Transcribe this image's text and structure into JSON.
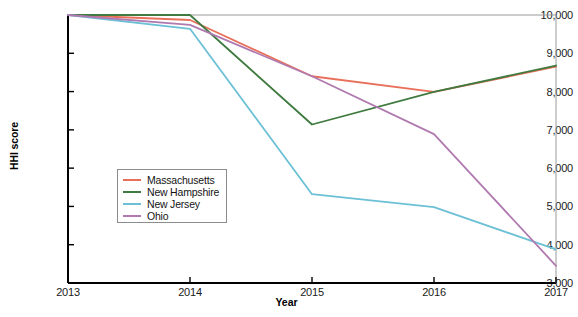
{
  "chart_data": {
    "type": "line",
    "title": "",
    "xlabel": "Year",
    "ylabel": "HHI score",
    "x": [
      2013,
      2014,
      2015,
      2016,
      2017
    ],
    "xlim": [
      2013,
      2017
    ],
    "ylim": [
      3000,
      10000
    ],
    "ytick_labels": [
      "3,000",
      "4,000",
      "5,000",
      "6,000",
      "7,000",
      "8,000",
      "9,000",
      "10,000"
    ],
    "ytick_values": [
      3000,
      4000,
      5000,
      6000,
      7000,
      8000,
      9000,
      10000
    ],
    "xtick_labels": [
      "2013",
      "2014",
      "2015",
      "2016",
      "2017"
    ],
    "xtick_values": [
      2013,
      2014,
      2015,
      2016,
      2017
    ],
    "grid": false,
    "legend_position": "center-left",
    "series": [
      {
        "name": "Massachusetts",
        "color": "#e8705a",
        "values": [
          10000,
          9870,
          8400,
          7990,
          8650
        ]
      },
      {
        "name": "New Hampshire",
        "color": "#3f7a3f",
        "values": [
          10000,
          10000,
          7140,
          7990,
          8680
        ]
      },
      {
        "name": "New Jersey",
        "color": "#6cc0d6",
        "values": [
          10000,
          9640,
          5320,
          4980,
          3880
        ]
      },
      {
        "name": "Ohio",
        "color": "#b07ab0",
        "values": [
          10000,
          9740,
          8400,
          6890,
          3450
        ]
      }
    ]
  },
  "legend": {
    "items": [
      {
        "label": "Massachusetts",
        "color": "#e8705a"
      },
      {
        "label": "New Hampshire",
        "color": "#3f7a3f"
      },
      {
        "label": "New Jersey",
        "color": "#6cc0d6"
      },
      {
        "label": "Ohio",
        "color": "#b07ab0"
      }
    ]
  },
  "axes": {
    "axis_color": "#000000",
    "tick_color": "#1a1a1a"
  }
}
